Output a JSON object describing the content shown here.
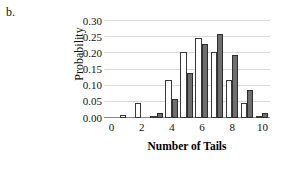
{
  "panel": {
    "label": "b."
  },
  "chart_data": {
    "type": "bar",
    "title": "",
    "xlabel": "Number of Tails",
    "ylabel": "Probability",
    "categories": [
      0,
      1,
      2,
      3,
      4,
      5,
      6,
      7,
      8,
      9,
      10
    ],
    "xtick_labels": [
      "0",
      "2",
      "4",
      "6",
      "8",
      "10"
    ],
    "xtick_values": [
      0,
      2,
      4,
      6,
      8,
      10
    ],
    "ytick_labels": [
      "0.00",
      "0.05",
      "0.10",
      "0.15",
      "0.20",
      "0.25",
      "0.30"
    ],
    "ytick_values": [
      0.0,
      0.05,
      0.1,
      0.15,
      0.2,
      0.25,
      0.3
    ],
    "ylim": [
      0.0,
      0.3
    ],
    "xlim": [
      -0.5,
      10.5
    ],
    "grid": "horizontal",
    "legend": "none",
    "series": [
      {
        "name": "open",
        "fill": "#ffffff",
        "edge": "#3a3a3a",
        "values": [
          0.001,
          0.008,
          0.047,
          0.003,
          0.117,
          0.205,
          0.246,
          0.205,
          0.117,
          0.046,
          0.005
        ]
      },
      {
        "name": "filled",
        "fill": "#6e6e6e",
        "edge": "#2e2e2e",
        "values": [
          0.0,
          0.0,
          0.001,
          0.016,
          0.059,
          0.138,
          0.229,
          0.259,
          0.194,
          0.087,
          0.016
        ]
      }
    ]
  },
  "colors": {
    "gridline": "#d9d9d9",
    "axis": "#8a8a8a",
    "text": "#111111"
  }
}
